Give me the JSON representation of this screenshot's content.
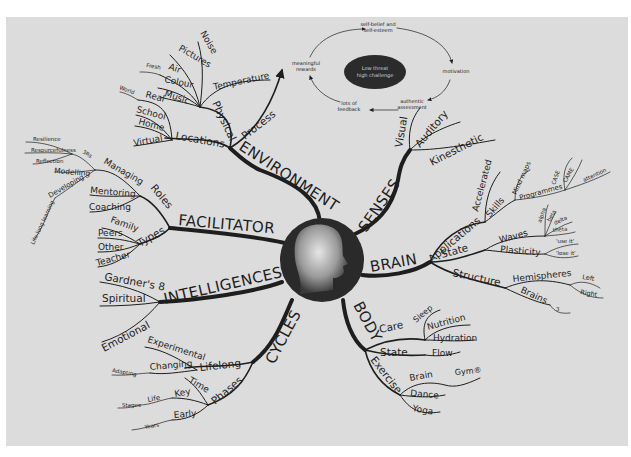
{
  "diagram": {
    "type": "mind-map",
    "center": {
      "icon": "head-profile-icon"
    },
    "cycle": {
      "center_label_1": "Low threat",
      "center_label_2": "high challenge",
      "nodes": {
        "self_belief_1": "self-belief and",
        "self_belief_2": "self-esteem",
        "motivation": "motivation",
        "authentic_1": "authentic",
        "authentic_2": "assessment",
        "feedback_1": "lots of",
        "feedback_2": "feedback",
        "rewards_1": "meaningful",
        "rewards_2": "rewards"
      }
    },
    "branches": {
      "environment": {
        "label": "ENVIRONMENT",
        "physical": {
          "label": "Physical",
          "items": [
            "Noise",
            "Pictures",
            "Air",
            "Fresh",
            "Colour",
            "Music",
            "Temperature"
          ]
        },
        "process": {
          "label": "Process"
        },
        "locations": {
          "label": "Locations",
          "items": [
            "Real",
            "World",
            "School",
            "Home",
            "Virtual"
          ]
        }
      },
      "facilitator": {
        "label": "FACILITATOR",
        "roles": {
          "label": "Roles",
          "items": [
            "Managing",
            "Mentoring",
            "Coaching"
          ]
        },
        "managing_items": [
          "3Rs",
          "Modelling",
          "Developing"
        ],
        "threers": [
          "Resilience",
          "Resourcefulness",
          "Reflection"
        ],
        "developing": "Life-long learning",
        "types": {
          "label": "Types",
          "items": [
            "Family",
            "Peers",
            "Other",
            "Teacher"
          ]
        }
      },
      "intelligences": {
        "label": "INTELLIGENCES",
        "items": [
          "Gardner's 8",
          "Spiritual",
          "Emotional"
        ]
      },
      "cycles": {
        "label": "CYCLES",
        "lifelong": {
          "label": "Lifelong",
          "items": [
            "Experimental",
            "Changing",
            "Adapting"
          ]
        },
        "phases": {
          "label": "Phases",
          "items": [
            "Time",
            "Key",
            "Life",
            "Stages",
            "Early",
            "Years"
          ]
        }
      },
      "senses": {
        "label": "SENSES",
        "items": [
          "Visual",
          "Auditory",
          "Kinesthetic"
        ]
      },
      "brain": {
        "label": "BRAIN",
        "applications": {
          "label": "Applications",
          "items": [
            "Accelerated",
            "Skills",
            "Mind maps",
            "Programmes",
            "CASE",
            "CAME",
            "attention"
          ]
        },
        "state": {
          "label": "State",
          "waves": "Waves",
          "wave_items": [
            "alpha",
            "beta",
            "delta",
            "theta"
          ],
          "plasticity": "Plasticity",
          "plasticity_items": [
            "'use it'",
            "'lose it'"
          ]
        },
        "structure": {
          "label": "Structure",
          "hemispheres": "Hemispheres",
          "hemi_items": [
            "Left",
            "Right"
          ],
          "brains": "Brains",
          "brains_count": "3"
        }
      },
      "body": {
        "label": "BODY",
        "care": {
          "label": "Care",
          "items": [
            "Sleep",
            "Nutrition",
            "Hydration"
          ]
        },
        "state": {
          "label": "State",
          "items": [
            "Flow"
          ]
        },
        "exercise": {
          "label": "Exercise",
          "items": [
            "Brain",
            "Gym®",
            "Dance",
            "Yoga"
          ]
        }
      }
    },
    "colors": {
      "background": "#dcdcdc",
      "ink": "#1e1e1e",
      "frame": "#ffffff"
    }
  }
}
